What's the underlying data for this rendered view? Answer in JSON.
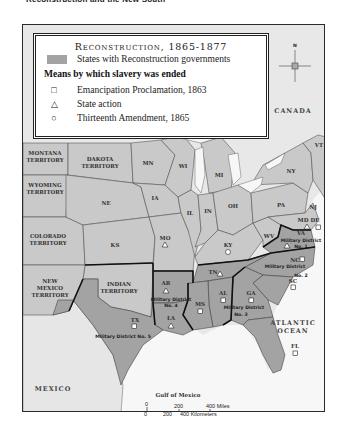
{
  "header": {
    "title": "Reconstruction and the New South"
  },
  "legend": {
    "title": "Reconstruction, 1865-1877",
    "swatch_label": "States with Reconstruction governments",
    "means_heading": "Means by which slavery was ended",
    "items": [
      {
        "symbol": "square",
        "glyph": "□",
        "label": "Emancipation Proclamation, 1863"
      },
      {
        "symbol": "triangle",
        "glyph": "△",
        "label": "State action"
      },
      {
        "symbol": "circle",
        "glyph": "○",
        "label": "Thirteenth Amendment, 1865"
      }
    ]
  },
  "compass": {
    "n": "N",
    "s": "S",
    "e": "E",
    "w": "W"
  },
  "regions": {
    "canada": "CANADA",
    "mexico": "MEXICO",
    "atlantic_1": "ATLANTIC",
    "atlantic_2": "OCEAN",
    "gulf": "Gulf of Mexico"
  },
  "territories": {
    "montana_1": "MONTANA",
    "montana_2": "TERRITORY",
    "dakota_1": "DAKOTA",
    "dakota_2": "TERRITORY",
    "wyoming_1": "WYOMING",
    "wyoming_2": "TERRITORY",
    "colorado_1": "COLORADO",
    "colorado_2": "TERRITORY",
    "newmexico_1": "NEW",
    "newmexico_2": "MEXICO",
    "newmexico_3": "TERRITORY",
    "indian_1": "INDIAN",
    "indian_2": "TERRITORY"
  },
  "states": {
    "MN": "MN",
    "WI": "WI",
    "MI": "MI",
    "IA": "IA",
    "NE": "NE",
    "KS": "KS",
    "IL": "IL",
    "IN": "IN",
    "OH": "OH",
    "PA": "PA",
    "NY": "NY",
    "VT": "VT",
    "NJ": "NJ",
    "MO": "MO",
    "KY": "KY",
    "WV": "WV",
    "MD": "MD",
    "DE": "DE",
    "VA": "VA",
    "NC": "NC",
    "SC": "SC",
    "GA": "GA",
    "FL": "FL",
    "AL": "AL",
    "MS": "MS",
    "LA": "LA",
    "AR": "AR",
    "TN": "TN",
    "TX": "TX"
  },
  "military_districts": {
    "d1": [
      "Military District",
      "No. 1"
    ],
    "d2": [
      "Military District",
      "No. 2"
    ],
    "d3": [
      "Military District",
      "No. 3"
    ],
    "d4": [
      "Military District",
      "No. 4"
    ],
    "d5": "Military District No. 5"
  },
  "scale": {
    "miles_0": "0",
    "miles_200": "200",
    "miles_400": "400 Miles",
    "km_0": "0",
    "km_200": "200",
    "km_400": "400 Kilometers"
  },
  "colors": {
    "reconstruction_states": "#a3a3a3",
    "other_states": "#c9c9c9",
    "foreign_land": "#e8e8e8",
    "water": "#f7f7f7",
    "border": "#2a2a2a"
  }
}
